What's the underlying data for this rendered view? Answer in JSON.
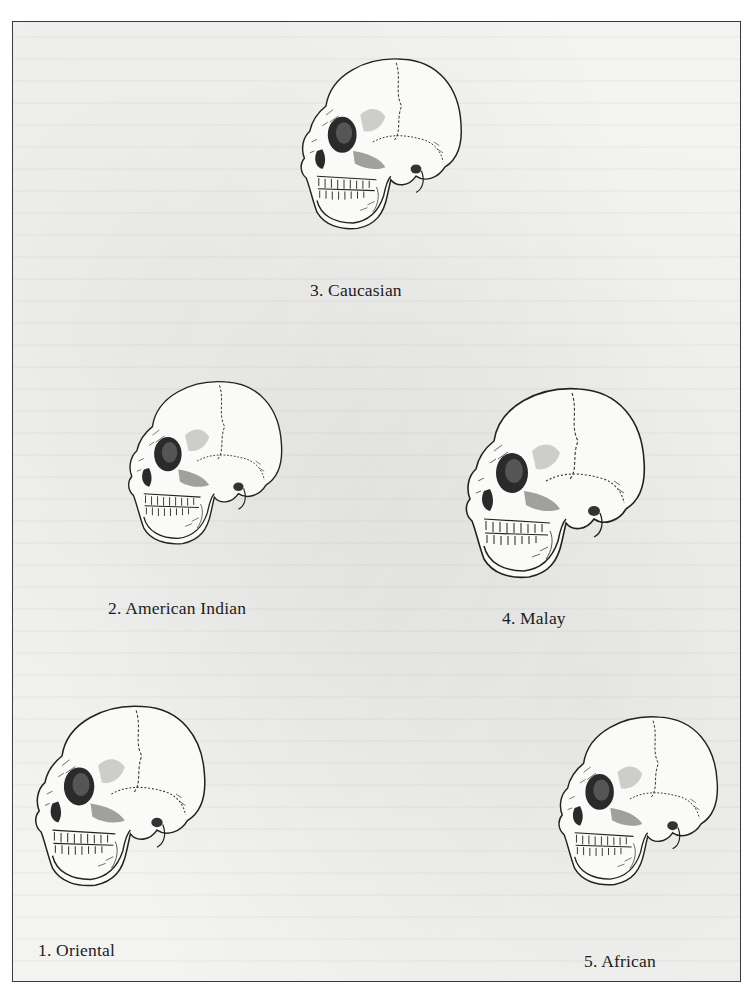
{
  "figures": [
    {
      "number": "3.",
      "name": "Caucasian",
      "label": "3. Caucasian"
    },
    {
      "number": "2.",
      "name": "American Indian",
      "label": "2. American Indian"
    },
    {
      "number": "4.",
      "name": "Malay",
      "label": "4. Malay"
    },
    {
      "number": "1.",
      "name": "Oriental",
      "label": "1. Oriental"
    },
    {
      "number": "5.",
      "name": "African",
      "label": "5. African"
    }
  ],
  "colors": {
    "ink": "#1c1c1c",
    "paper": "#f3f3f1",
    "border": "#3a3a3a"
  }
}
